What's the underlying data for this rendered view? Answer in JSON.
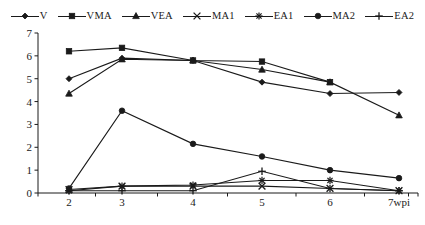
{
  "chart_data": {
    "type": "line",
    "title": "",
    "subtitle": "",
    "xlabel": "wpi",
    "ylabel": "",
    "categories": [
      "2",
      "3",
      "4",
      "5",
      "6",
      "7wpi"
    ],
    "x_tick_labels": [
      "2",
      "3",
      "4",
      "5",
      "6",
      "7wpi"
    ],
    "y_tick_labels": [
      "0",
      "1",
      "2",
      "3",
      "4",
      "5",
      "6",
      "7"
    ],
    "ylim": [
      0,
      7
    ],
    "y_tick_step": 1,
    "grid": false,
    "legend_position": "top-center",
    "color": "#1a1a1a",
    "series": [
      {
        "name": "V",
        "marker": "diamond",
        "values": [
          5.0,
          5.9,
          5.8,
          4.85,
          4.35,
          4.4
        ]
      },
      {
        "name": "VMA",
        "marker": "square",
        "values": [
          6.2,
          6.35,
          5.8,
          5.75,
          4.85,
          null
        ]
      },
      {
        "name": "VEA",
        "marker": "triangle",
        "values": [
          4.35,
          5.85,
          5.8,
          5.4,
          4.85,
          3.4
        ]
      },
      {
        "name": "MA1",
        "marker": "cross-x",
        "values": [
          0.15,
          0.3,
          0.3,
          0.3,
          0.2,
          0.1
        ]
      },
      {
        "name": "EA1",
        "marker": "asterisk",
        "values": [
          0.1,
          0.3,
          0.35,
          0.55,
          0.55,
          0.1
        ]
      },
      {
        "name": "MA2",
        "marker": "circle",
        "values": [
          0.2,
          3.6,
          2.15,
          1.6,
          1.0,
          0.65
        ]
      },
      {
        "name": "EA2",
        "marker": "plus",
        "values": [
          0.1,
          0.1,
          0.1,
          0.95,
          0.2,
          0.1
        ]
      }
    ]
  }
}
